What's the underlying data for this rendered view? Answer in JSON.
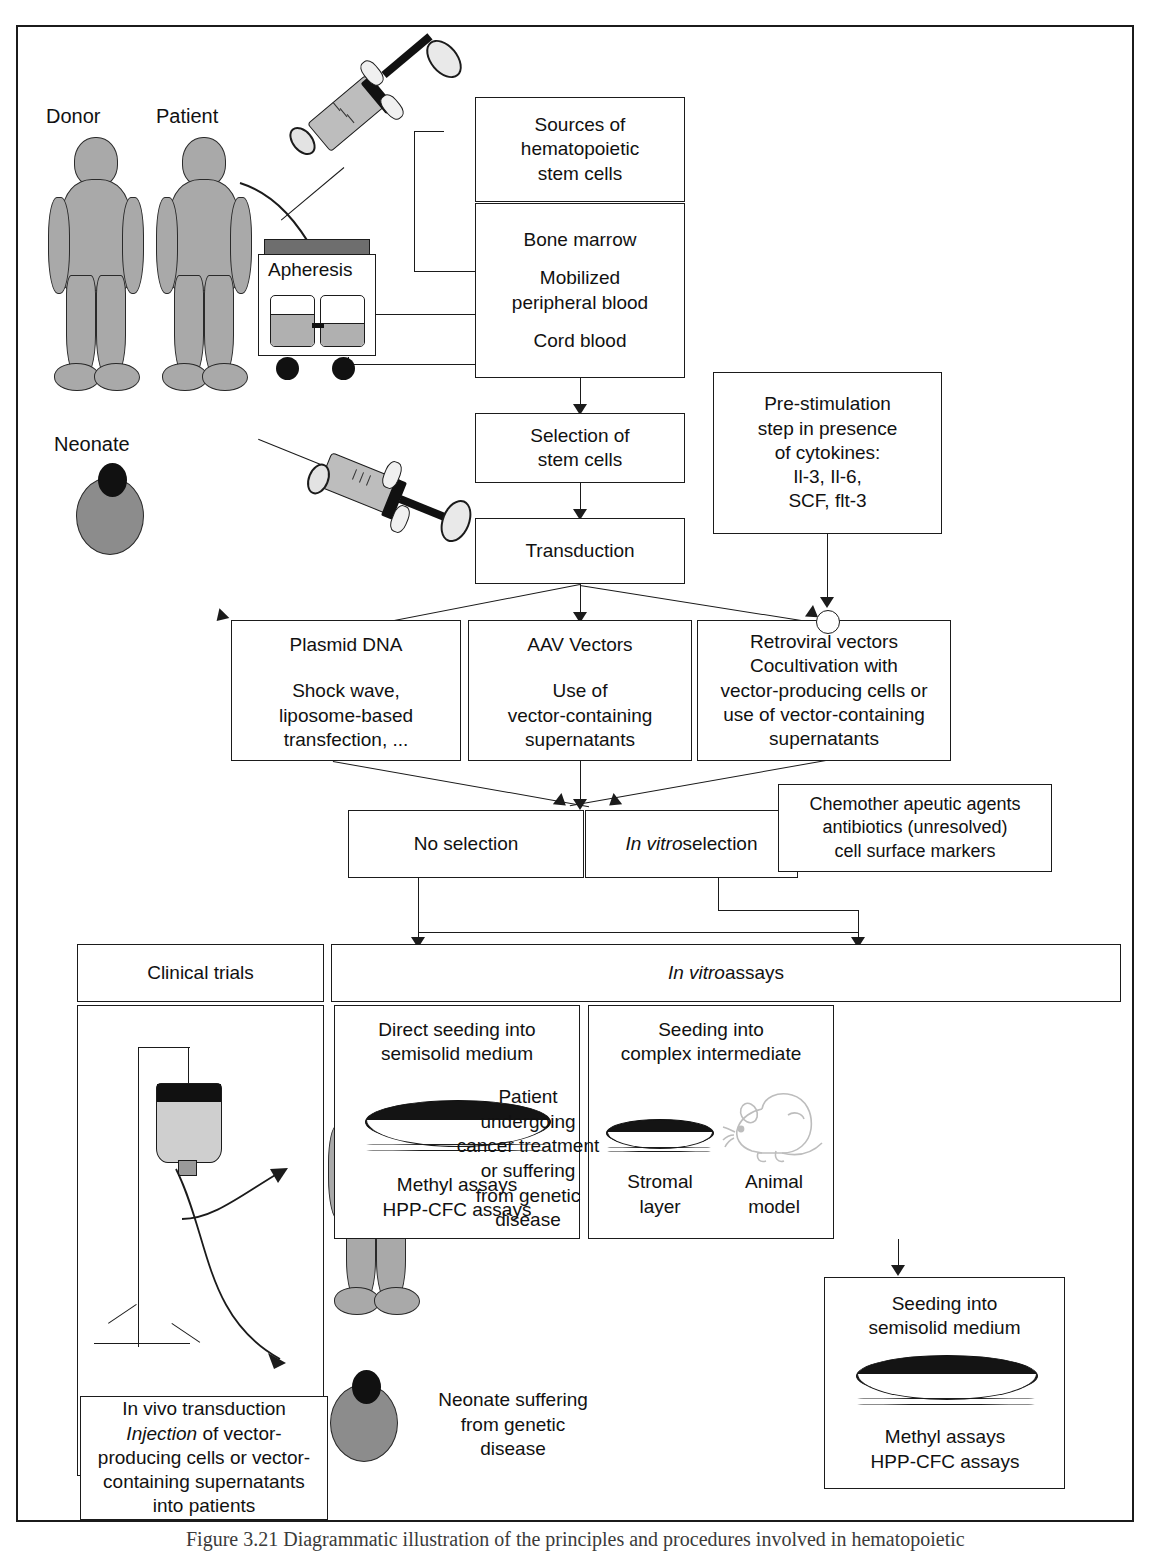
{
  "figure": {
    "caption": "Figure 3.21  Diagrammatic illustration of the principles and procedures involved in hematopoietic"
  },
  "labels": {
    "donor": "Donor",
    "patient": "Patient",
    "neonate": "Neonate",
    "apheresis": "Apheresis"
  },
  "boxes": {
    "sources": {
      "lines": [
        "Sources of",
        "hematopoietic",
        "stem cells"
      ]
    },
    "sources_list": {
      "lines": [
        "Bone marrow",
        "",
        "Mobilized",
        "peripheral blood",
        "",
        "Cord blood"
      ]
    },
    "selection": {
      "lines": [
        "Selection of",
        "stem cells"
      ]
    },
    "transduction": {
      "lines": [
        "Transduction"
      ]
    },
    "prestim": {
      "lines": [
        "Pre-stimulation",
        "step in presence",
        "of cytokines:",
        "Il-3, Il-6,",
        "SCF, flt-3"
      ]
    },
    "plasmid": {
      "title": "Plasmid DNA",
      "lines": [
        "Shock wave,",
        "liposome-based",
        "transfection, ..."
      ]
    },
    "aav": {
      "title": "AAV Vectors",
      "lines": [
        "Use of",
        "vector-containing",
        "supernatants"
      ]
    },
    "retro": {
      "lines": [
        "Retroviral vectors",
        "Cocultivation with",
        "vector-producing cells or",
        "use of vector-containing",
        "supernatants"
      ]
    },
    "no_selection": {
      "label": "No selection"
    },
    "in_vitro_selection": {
      "label_italic": "In vitro",
      "label_rest": " selection"
    },
    "markers": {
      "lines": [
        "Chemother apeutic agents",
        "antibiotics (unresolved)",
        "cell surface markers"
      ]
    },
    "clinical_trials": {
      "label": "Clinical trials"
    },
    "in_vitro_assays": {
      "label_italic": "In vitro",
      "label_rest": " assays"
    },
    "direct_seeding": {
      "title_lines": [
        "Direct seeding into",
        "semisolid medium"
      ],
      "footer_lines": [
        "Methyl assays",
        "HPP-CFC assays"
      ]
    },
    "complex_intermediate": {
      "title_lines": [
        "Seeding into",
        "complex intermediate"
      ],
      "stromal_lines": [
        "Stromal",
        "layer"
      ],
      "animal_lines": [
        "Animal",
        "model"
      ]
    },
    "seeding_semisolid": {
      "title_lines": [
        "Seeding into",
        "semisolid medium"
      ],
      "footer_lines": [
        "Methyl assays",
        "HPP-CFC assays"
      ]
    },
    "in_vivo": {
      "lines": [
        "In vivo transduction",
        "Injection of vector-",
        "producing cells or vector-",
        "containing supernatants",
        "into patients"
      ],
      "italic_word": "Injection"
    }
  },
  "annotations": {
    "patient_outcome": {
      "lines": [
        "Patient",
        "undergoing",
        "cancer treatment",
        "or suffering",
        "from genetic",
        "disease"
      ]
    },
    "neonate_outcome": {
      "lines": [
        "Neonate suffering",
        "from genetic",
        "disease"
      ]
    }
  },
  "colors": {
    "ink": "#1b1b1b",
    "body_fill": "#a9a9a9",
    "neonate_fill": "#8c8c8c",
    "dish_medium": "#141414",
    "machine_gray": "#6e6e6e"
  }
}
